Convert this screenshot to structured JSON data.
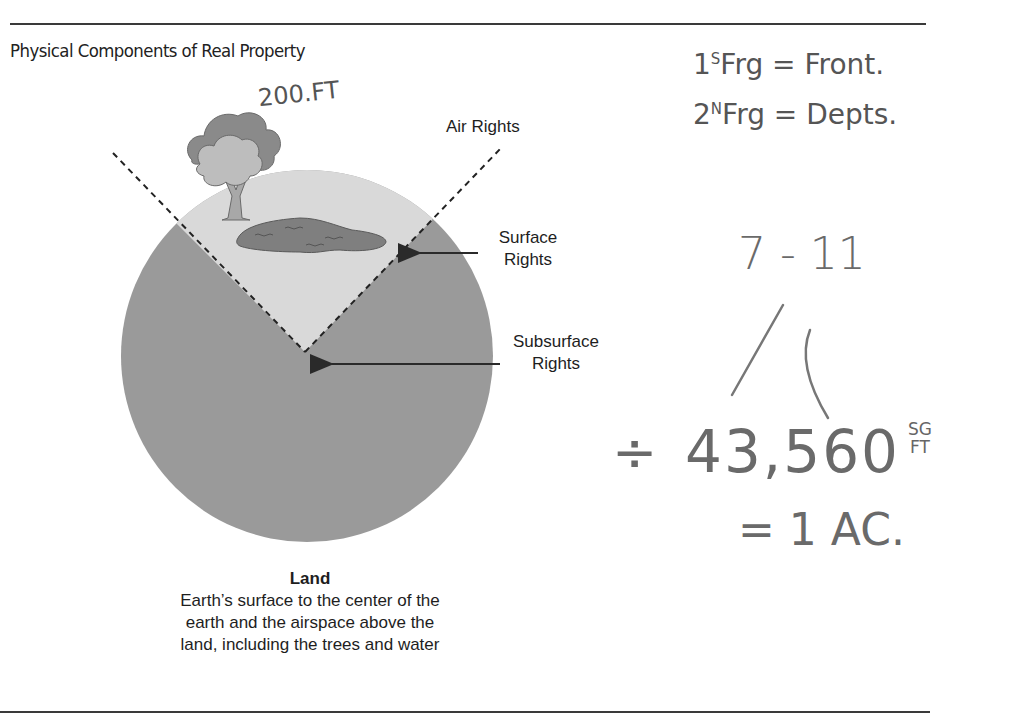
{
  "figure": {
    "title": "Physical Components of Real Property",
    "labels": {
      "air_rights": "Air Rights",
      "surface_rights_line1": "Surface",
      "surface_rights_line2": "Rights",
      "subsurface_rights_line1": "Subsurface",
      "subsurface_rights_line2": "Rights"
    },
    "caption": {
      "heading": "Land",
      "line1": "Earth’s surface to the center of the",
      "line2": "earth and the airspace above the",
      "line3": "land, including the trees and water"
    },
    "colors": {
      "earth": "#9a9a9a",
      "surface_wedge": "#d9d9d9",
      "pond": "#7f7f7f",
      "tree_canopy_dark": "#8a8a8a",
      "tree_canopy_light": "#bdbdbd",
      "rule": "#3a3a3a"
    }
  },
  "handwritten_notes": {
    "height_note": "200.FT",
    "line1_prefix": "1",
    "line1_sup": "S",
    "line1_rest": "Frg = Front.",
    "line2_prefix": "2",
    "line2_sup": "N",
    "line2_rest": "Frg = Depts.",
    "ratio": "7 - 11",
    "divide_symbol": "÷",
    "acre_value": "43,560",
    "unit_top": "SG",
    "unit_bottom": "FT",
    "equals_line": "= 1 AC."
  }
}
